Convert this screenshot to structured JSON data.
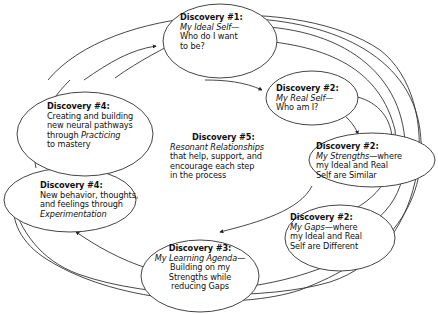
{
  "diagram": {
    "type": "cycle-flow",
    "colors": {
      "line": "#333333",
      "ellipse_stroke": "#444444",
      "text": "#111111",
      "background": "#ffffff"
    },
    "nodes": [
      {
        "id": "d1",
        "title": "Discovery #1:",
        "lines": [
          {
            "text": "My Ideal Self—",
            "italic": true
          },
          {
            "text": "Who do I want"
          },
          {
            "text": "to be?"
          }
        ]
      },
      {
        "id": "d2a",
        "title": "Discovery #2:",
        "lines": [
          {
            "text": "My Real Self—",
            "italic": true
          },
          {
            "text": "Who am I?"
          }
        ]
      },
      {
        "id": "d2b",
        "title": "Discovery #2:",
        "lines_html": [
          [
            "My Strengths",
            "—where"
          ],
          [
            "my Ideal and Real"
          ],
          [
            "Self are Similar"
          ]
        ]
      },
      {
        "id": "d2c",
        "title": "Discovery #2:",
        "lines_html": [
          [
            "My Gaps",
            "—where"
          ],
          [
            "my Ideal and Real"
          ],
          [
            "Self are Different"
          ]
        ]
      },
      {
        "id": "d3",
        "title": "Discovery #3:",
        "lines_html": [
          [
            "My Learning Agenda",
            "—"
          ],
          [
            "Building on my"
          ],
          [
            "Strengths while"
          ],
          [
            "reducing Gaps"
          ]
        ]
      },
      {
        "id": "d4b",
        "title": "Discovery #4:",
        "lines_html": [
          [
            "New behavior, thoughts,"
          ],
          [
            "and feelings through"
          ],
          [
            "Experimentation",
            ""
          ]
        ]
      },
      {
        "id": "d4a",
        "title": "Discovery #4:",
        "lines_html": [
          [
            "Creating and building"
          ],
          [
            "new neural pathways"
          ],
          [
            "through ",
            "Practicing"
          ],
          [
            "to mastery"
          ]
        ]
      },
      {
        "id": "d5",
        "title": "Discovery #5:",
        "lines_html": [
          [
            "Resonant Relationships",
            ""
          ],
          [
            "that help, support, and"
          ],
          [
            "encourage each step"
          ],
          [
            "in the process"
          ]
        ]
      }
    ],
    "text": {
      "d1": {
        "title": "Discovery #1:",
        "l1": "My Ideal Self—",
        "l2": "Who do I want",
        "l3": "to be?"
      },
      "d2a": {
        "title": "Discovery #2:",
        "l1": "My Real Self—",
        "l2": "Who am I?"
      },
      "d2b": {
        "title": "Discovery #2:",
        "l1i": "My Strengths",
        "l1": "—where",
        "l2": "my Ideal and Real",
        "l3": "Self are Similar"
      },
      "d2c": {
        "title": "Discovery #2:",
        "l1i": "My Gaps",
        "l1": "—where",
        "l2": "my Ideal and Real",
        "l3": "Self are Different"
      },
      "d3": {
        "title": "Discovery #3:",
        "l1i": "My Learning Agenda",
        "l1": "—",
        "l2": "Building on my",
        "l3": "Strengths while",
        "l4": "reducing Gaps"
      },
      "d4b": {
        "title": "Discovery #4:",
        "l1": "New behavior, thoughts,",
        "l2": "and feelings through",
        "l3i": "Experimentation"
      },
      "d4a": {
        "title": "Discovery #4:",
        "l1": "Creating and building",
        "l2": "new neural pathways",
        "l3": "through ",
        "l3i": "Practicing",
        "l4": "to mastery"
      },
      "d5": {
        "title": "Discovery #5:",
        "l1i": "Resonant Relationships",
        "l2": "that help, support, and",
        "l3": "encourage each step",
        "l4": "in the process"
      }
    },
    "edges": [
      {
        "from": "d1",
        "to": "d2a"
      },
      {
        "from": "d2a",
        "to": "d2b"
      },
      {
        "from": "d2a",
        "to": "d2c"
      },
      {
        "from": "d1",
        "to": "d2b"
      },
      {
        "from": "d1",
        "to": "d2c"
      },
      {
        "from": "d1",
        "to": "d3"
      },
      {
        "from": "d2b",
        "to": "d3"
      },
      {
        "from": "d2c",
        "to": "d3"
      },
      {
        "from": "d3",
        "to": "d4b"
      },
      {
        "from": "d4b",
        "to": "d4a"
      },
      {
        "from": "d4a",
        "to": "d1"
      }
    ]
  }
}
